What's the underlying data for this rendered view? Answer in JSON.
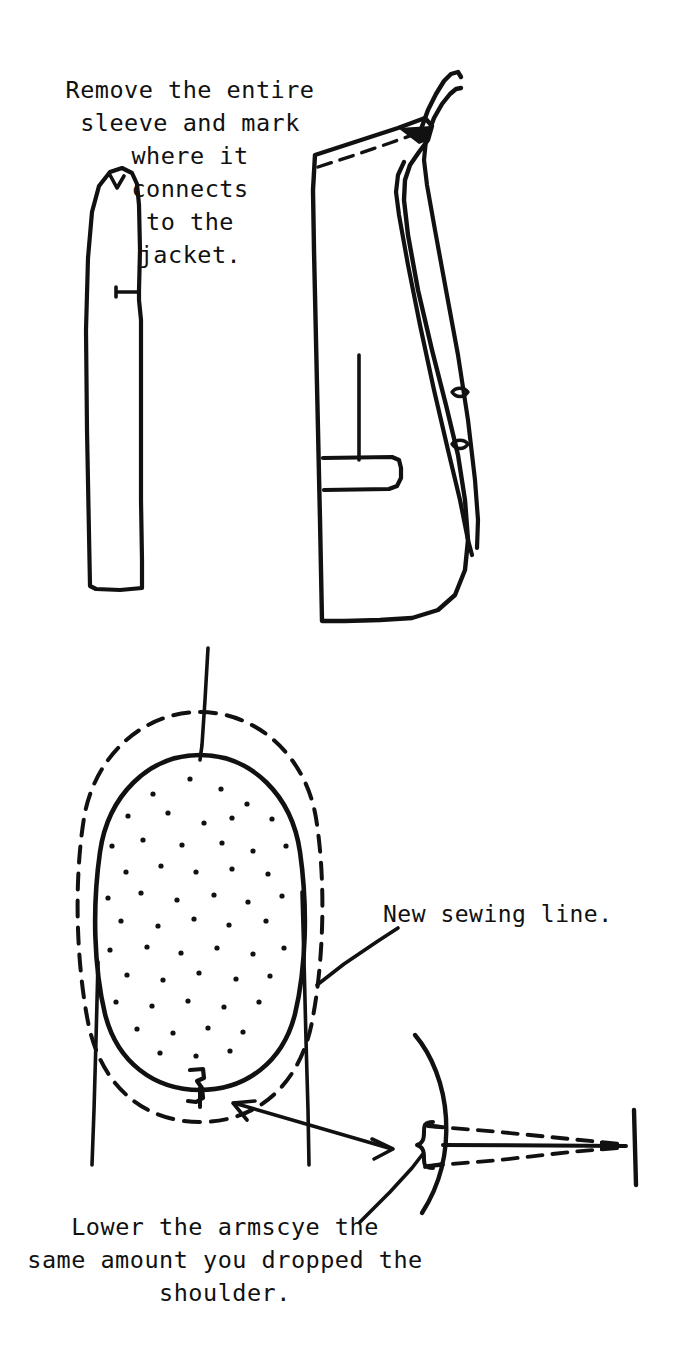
{
  "page": {
    "background_color": "#ffffff",
    "ink_color": "#111111",
    "width": 676,
    "height": 1345
  },
  "captions": {
    "top": "Remove the entire\nsleeve and mark\nwhere it\nconnects\nto the\njacket.",
    "new_sewing_line": "New sewing line.",
    "bottom": "Lower the armscye the\nsame amount you dropped the\nshoulder."
  },
  "figures": {
    "upper": {
      "name": "Removed sleeve and jacket body",
      "parts": [
        {
          "id": "sleeve-outline",
          "label": "detached sleeve piece"
        },
        {
          "id": "sleeve-notch-top",
          "label": "top notch mark"
        },
        {
          "id": "sleeve-notch-side",
          "label": "side notch mark"
        },
        {
          "id": "jacket-body-outline",
          "label": "jacket side body"
        },
        {
          "id": "jacket-shoulder-dashed",
          "label": "dashed shoulder seam line"
        },
        {
          "id": "jacket-lapel",
          "label": "lapel and collar"
        },
        {
          "id": "jacket-pocket",
          "label": "flap pocket"
        },
        {
          "id": "jacket-front-seam",
          "label": "front dart seam"
        },
        {
          "id": "jacket-buttonhole-upper",
          "label": "upper buttonhole"
        },
        {
          "id": "jacket-buttonhole-lower",
          "label": "lower buttonhole"
        }
      ]
    },
    "lower": {
      "name": "Armscye lowering detail",
      "parts": [
        {
          "id": "armscye-solid-oval",
          "label": "original armscye opening, stippled"
        },
        {
          "id": "armscye-dashed-oval",
          "label": "new lowered armscye sewing line"
        },
        {
          "id": "shoulder-seam-line",
          "label": "shoulder seam line"
        },
        {
          "id": "side-seam-left",
          "label": "left side seam"
        },
        {
          "id": "side-seam-right",
          "label": "right side seam"
        },
        {
          "id": "notch-mark",
          "label": "underarm notch mark"
        },
        {
          "id": "double-arrow",
          "label": "double headed arrow linking notch to brace"
        },
        {
          "id": "brace-bracket",
          "label": "curly brace showing drop amount"
        },
        {
          "id": "detail-curve",
          "label": "armscye edge curve in detail view"
        },
        {
          "id": "detail-dashed-taper",
          "label": "tapered dashed blending lines"
        },
        {
          "id": "detail-end-bar",
          "label": "end bar of blend"
        }
      ]
    }
  }
}
